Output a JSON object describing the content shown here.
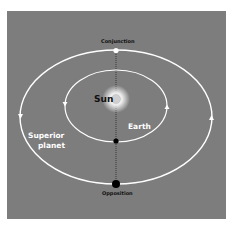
{
  "diagram": {
    "type": "orbital-configuration",
    "background_color": "#7d7d7d",
    "orbit_color": "#ffffff",
    "labels": {
      "conjunction": "Conjunction",
      "sun": "Sun",
      "earth": "Earth",
      "superior_planet_line1": "Superior",
      "superior_planet_line2": "planet",
      "opposition": "Opposition"
    },
    "bodies": [
      {
        "name": "Sun",
        "color": "#d9d9d9",
        "glow": "#ffffff"
      },
      {
        "name": "Earth",
        "color": "#000000"
      },
      {
        "name": "Superior planet at opposition",
        "color": "#000000"
      },
      {
        "name": "Superior planet at conjunction",
        "color": "#ffffff"
      }
    ],
    "orbits": [
      {
        "name": "Earth orbit",
        "direction": "counterclockwise"
      },
      {
        "name": "Superior planet orbit",
        "direction": "counterclockwise"
      }
    ],
    "alignment_line": "dotted vertical line through Sun, Earth and planet"
  }
}
